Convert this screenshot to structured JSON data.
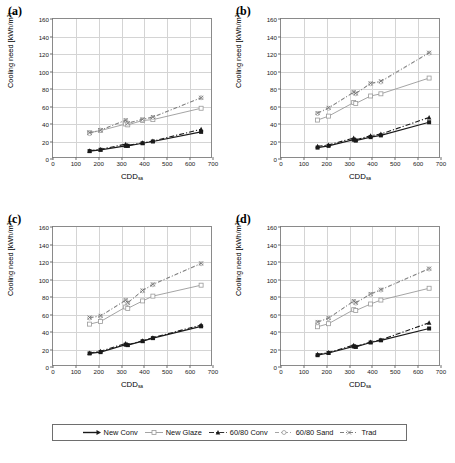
{
  "figure": {
    "axis": {
      "ylabel_text": "Cooling need [kWh/m",
      "ylabel_sup": "2",
      "ylabel_tail": "]",
      "xlabel_text": "CDD",
      "xlabel_sub": "sa",
      "xticks": [
        "0",
        "100",
        "200",
        "300",
        "400",
        "500",
        "600",
        "700"
      ],
      "yticks": [
        "0",
        "20",
        "40",
        "60",
        "80",
        "100",
        "120",
        "140",
        "160"
      ],
      "xlim": [
        0,
        700
      ],
      "ylim": [
        0,
        160
      ],
      "grid": true
    },
    "legend": {
      "position": "bottom-center",
      "entries": [
        {
          "name": "New Conv",
          "marker": "square-filled",
          "color": "#1a1a1a",
          "dash": "solid"
        },
        {
          "name": "New Glaze",
          "marker": "square-open",
          "color": "#9a9a9a",
          "dash": "solid"
        },
        {
          "name": "60/80 Conv",
          "marker": "triangle-filled",
          "color": "#1a1a1a",
          "dash": "dashdot"
        },
        {
          "name": "60/80 Sand",
          "marker": "circle-open",
          "color": "#9a9a9a",
          "dash": "dashdot"
        },
        {
          "name": "Trad",
          "marker": "cross-x",
          "color": "#6f6f6f",
          "dash": "dashdot"
        }
      ]
    }
  },
  "chart_data": [
    {
      "type": "scatter",
      "panel": "(a)",
      "title": "",
      "xlabel": "CDDsa",
      "ylabel": "Cooling need [kWh/m2]",
      "xlim": [
        0,
        700
      ],
      "ylim": [
        0,
        160
      ],
      "grid": true,
      "x": [
        160,
        208,
        318,
        327,
        392,
        437,
        648
      ],
      "series": [
        {
          "name": "New Conv",
          "values": [
            9,
            10.5,
            15,
            15,
            18,
            20,
            31
          ]
        },
        {
          "name": "New Glaze",
          "values": [
            30,
            32.5,
            40,
            39,
            44,
            45,
            58
          ]
        },
        {
          "name": "60/80 Conv",
          "values": [
            9.5,
            11,
            17,
            15.5,
            18.5,
            20.5,
            34
          ]
        },
        {
          "name": "60/80 Sand",
          "values": [
            29,
            33,
            44,
            41,
            45,
            47.5,
            70
          ]
        },
        {
          "name": "Trad",
          "values": [
            30,
            33,
            44.5,
            41,
            45.5,
            48,
            70
          ]
        }
      ]
    },
    {
      "type": "scatter",
      "panel": "(b)",
      "title": "",
      "xlabel": "CDDsa",
      "ylabel": "Cooling need [kWh/m2]",
      "xlim": [
        0,
        700
      ],
      "ylim": [
        0,
        160
      ],
      "grid": true,
      "x": [
        160,
        208,
        318,
        327,
        392,
        437,
        648
      ],
      "series": [
        {
          "name": "New Conv",
          "values": [
            13,
            15,
            22,
            21,
            25,
            27,
            42
          ]
        },
        {
          "name": "New Glaze",
          "values": [
            44.5,
            49,
            64.5,
            63.5,
            72,
            74.5,
            92.5
          ]
        },
        {
          "name": "60/80 Conv",
          "values": [
            14.5,
            16,
            24,
            22,
            26.5,
            28.5,
            47.5
          ]
        },
        {
          "name": "60/80 Sand",
          "values": [
            52,
            58,
            76,
            74.5,
            86,
            88,
            121
          ]
        },
        {
          "name": "Trad",
          "values": [
            52.5,
            58.5,
            76.5,
            75,
            86.5,
            89,
            121.5
          ]
        }
      ]
    },
    {
      "type": "scatter",
      "panel": "(c)",
      "title": "",
      "xlabel": "CDDsa",
      "ylabel": "Cooling need [kWh/m2]",
      "xlim": [
        0,
        700
      ],
      "ylim": [
        0,
        160
      ],
      "grid": true,
      "x": [
        160,
        208,
        318,
        327,
        392,
        437,
        648
      ],
      "series": [
        {
          "name": "New Conv",
          "values": [
            15.5,
            17,
            25.5,
            25,
            29.5,
            33,
            46.5
          ]
        },
        {
          "name": "New Glaze",
          "values": [
            49,
            52,
            68.5,
            67,
            75.5,
            81,
            93.5
          ]
        },
        {
          "name": "60/80 Conv",
          "values": [
            16,
            18,
            27,
            25.5,
            30,
            33.5,
            48
          ]
        },
        {
          "name": "60/80 Sand",
          "values": [
            56,
            58,
            76,
            73,
            87,
            94,
            118
          ]
        },
        {
          "name": "Trad",
          "values": [
            56.5,
            58.5,
            76.5,
            73.5,
            87.5,
            94.5,
            118.5
          ]
        }
      ]
    },
    {
      "type": "scatter",
      "panel": "(d)",
      "title": "",
      "xlabel": "CDDsa",
      "ylabel": "Cooling need [kWh/m2]",
      "xlim": [
        0,
        700
      ],
      "ylim": [
        0,
        160
      ],
      "grid": true,
      "x": [
        160,
        208,
        318,
        327,
        392,
        437,
        648
      ],
      "series": [
        {
          "name": "New Conv",
          "values": [
            13.5,
            16,
            23.5,
            23,
            28,
            30.5,
            44
          ]
        },
        {
          "name": "New Glaze",
          "values": [
            46,
            49.5,
            65.5,
            64.5,
            72,
            76.5,
            90
          ]
        },
        {
          "name": "60/80 Conv",
          "values": [
            14.5,
            16.5,
            25,
            23.5,
            28.5,
            31,
            50.5
          ]
        },
        {
          "name": "60/80 Sand",
          "values": [
            51,
            55.5,
            75,
            73,
            83,
            88,
            112
          ]
        },
        {
          "name": "Trad",
          "values": [
            51.5,
            56,
            75.5,
            73.5,
            83.5,
            88.5,
            112.5
          ]
        }
      ]
    }
  ],
  "panels": [
    {
      "label": "(a)",
      "left": 0,
      "top": 0
    },
    {
      "label": "(b)",
      "left": 228,
      "top": 0
    },
    {
      "label": "(c)",
      "left": 0,
      "top": 208
    },
    {
      "label": "(d)",
      "left": 228,
      "top": 208
    }
  ]
}
